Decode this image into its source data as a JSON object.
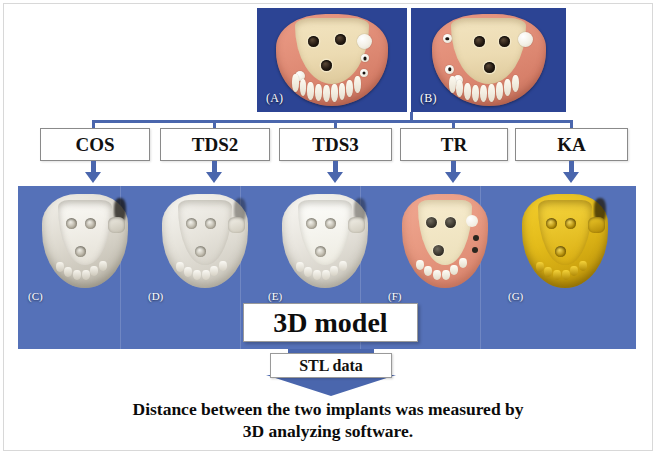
{
  "figure": {
    "colors": {
      "panel_blue": "#5571b8",
      "photo_blue": "#2c4494",
      "connector_blue": "#4a66ad",
      "box_border": "#8a8a8a",
      "text": "#0b0b0b"
    }
  },
  "top_photos": [
    {
      "label": "(A)",
      "name": "master-cast-photo-a"
    },
    {
      "label": "(B)",
      "name": "master-cast-photo-b"
    }
  ],
  "methods": [
    {
      "label": "COS",
      "left": 40,
      "width": 110
    },
    {
      "label": "TDS2",
      "left": 160,
      "width": 110
    },
    {
      "label": "TDS3",
      "left": 279,
      "width": 113
    },
    {
      "label": "TR",
      "left": 400,
      "width": 108
    },
    {
      "label": "KA",
      "left": 515,
      "width": 113
    }
  ],
  "models": [
    {
      "label": "(C)",
      "left": 26,
      "style": "plaster-white"
    },
    {
      "label": "(D)",
      "left": 146,
      "style": "plaster-light"
    },
    {
      "label": "(E)",
      "left": 266,
      "style": "plaster-light"
    },
    {
      "label": "(F)",
      "left": 386,
      "style": "photoreal-pink"
    },
    {
      "label": "(G)",
      "left": 506,
      "style": "gold-scan"
    }
  ],
  "model_box": {
    "label": "3D model"
  },
  "stl": {
    "label": "STL data"
  },
  "caption": {
    "line1": "Distance between the two implants was measured by",
    "line2": "3D analyzing software."
  }
}
